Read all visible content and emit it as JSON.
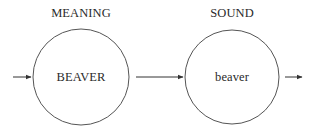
{
  "diagram": {
    "stages": [
      {
        "title": "MEANING",
        "node_label": "BEAVER",
        "center_x": 81,
        "center_y": 77,
        "radius": 48
      },
      {
        "title": "SOUND",
        "node_label": "beaver",
        "center_x": 232,
        "center_y": 77,
        "radius": 47
      }
    ],
    "arrows": [
      {
        "name": "input-arrow",
        "x1": 13,
        "x2": 31,
        "y": 77
      },
      {
        "name": "meaning-to-sound-arrow",
        "x1": 136,
        "x2": 183,
        "y": 77
      },
      {
        "name": "output-arrow",
        "x1": 285,
        "x2": 302,
        "y": 77
      }
    ],
    "colors": {
      "stroke": "#555555",
      "arrow": "#333333",
      "text": "#2a2a2a",
      "background": "#ffffff"
    }
  }
}
